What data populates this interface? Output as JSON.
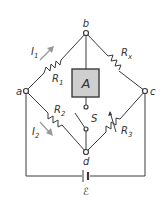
{
  "diagram": {
    "type": "wheatstone-bridge",
    "nodes": {
      "a": "a",
      "b": "b",
      "c": "c",
      "d": "d"
    },
    "resistors": {
      "r1": {
        "label": "R",
        "sub": "1"
      },
      "rx": {
        "label": "R",
        "sub": "x"
      },
      "r2": {
        "label": "R",
        "sub": "2"
      },
      "r3": {
        "label": "R",
        "sub": "3"
      }
    },
    "currents": {
      "i1": {
        "label": "I",
        "sub": "1"
      },
      "i2": {
        "label": "I",
        "sub": "2"
      }
    },
    "ammeter": {
      "label": "A",
      "fill": "#cfcfcf"
    },
    "switch": {
      "label": "S"
    },
    "battery": {
      "label": "ℰ"
    },
    "colors": {
      "wire": "#3a3a3a",
      "arrow": "#999999",
      "ammeter_fill": "#cfcfcf"
    }
  }
}
